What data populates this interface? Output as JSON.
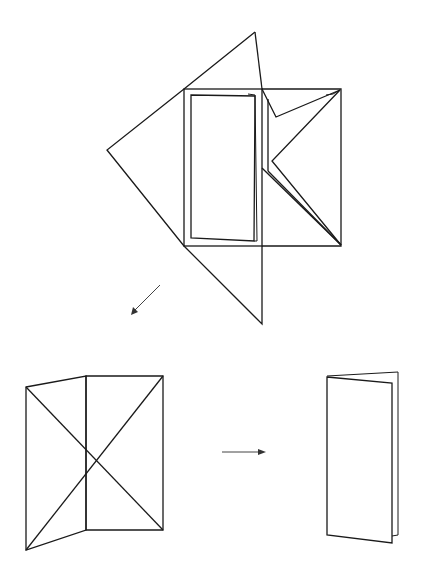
{
  "figure": {
    "title": "",
    "colors": {
      "line": "#1a1a1a",
      "arrow": "#444444",
      "background": "#ffffff"
    },
    "steps": [
      {
        "id": "step-fold-flaps",
        "label": "",
        "position": "top-center"
      },
      {
        "id": "step-open-creased",
        "label": "",
        "position": "bottom-left"
      },
      {
        "id": "step-finished-booklet",
        "label": "",
        "position": "bottom-right"
      }
    ],
    "arrows": [
      {
        "id": "arrow-down-left",
        "direction": "down-left"
      },
      {
        "id": "arrow-right",
        "direction": "right"
      }
    ]
  }
}
